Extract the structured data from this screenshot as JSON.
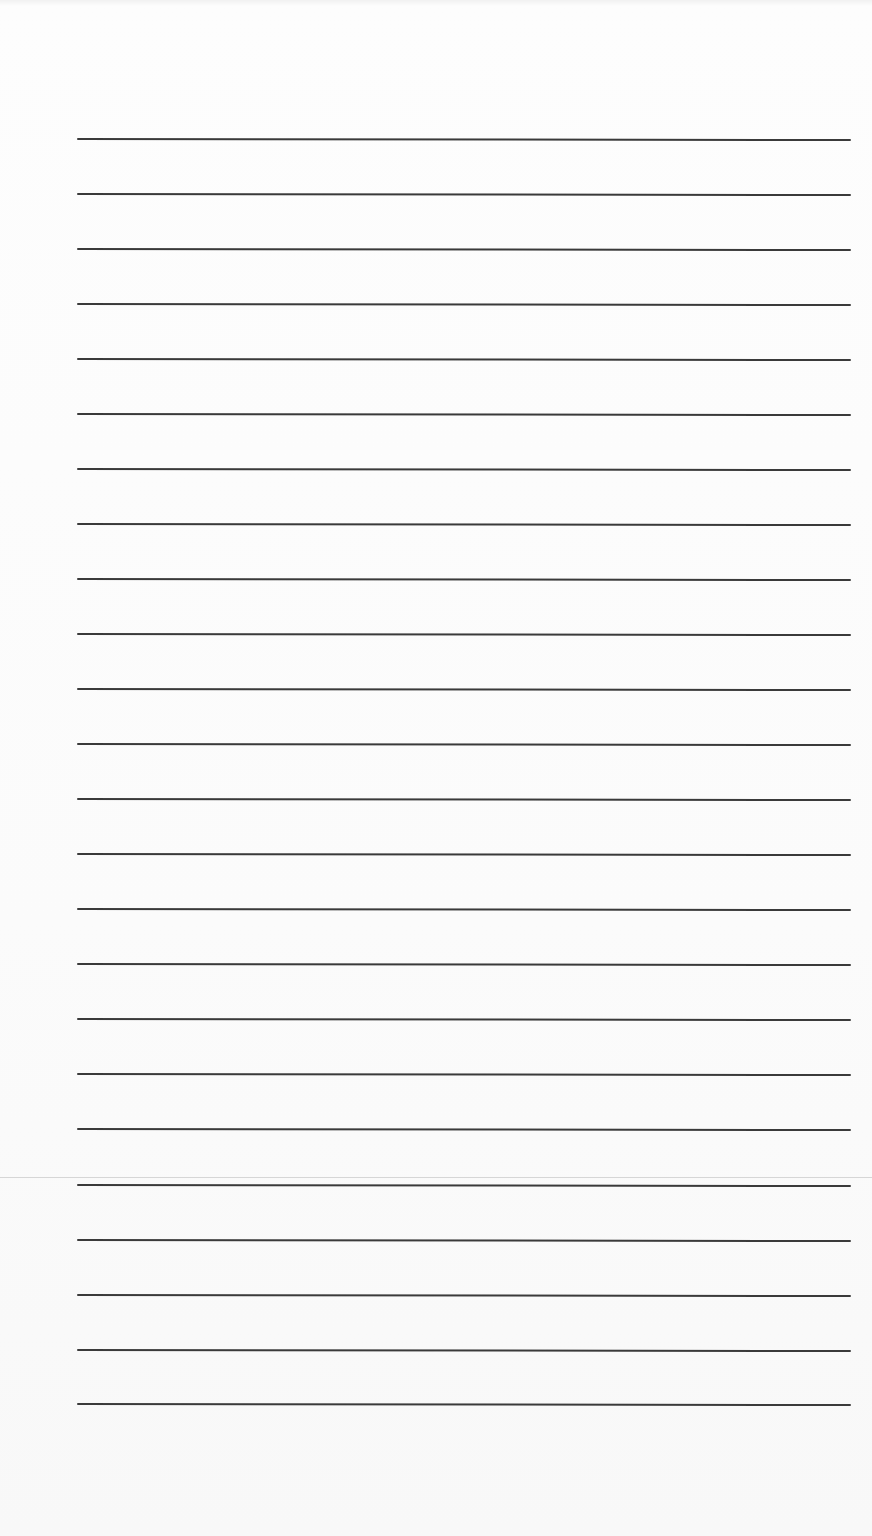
{
  "document": {
    "type": "lined-paper",
    "background_color": "#fcfcfc",
    "rule_color": "#3a3a3a",
    "seam_color": "#d6d6d6",
    "rule_count": 24,
    "rule_left_px": 77,
    "rule_right_px": 851,
    "rules_y_px": [
      138,
      193,
      248,
      303,
      358,
      413,
      468,
      523,
      578,
      633,
      688,
      743,
      798,
      853,
      908,
      963,
      1018,
      1073,
      1128,
      1184,
      1239,
      1294,
      1349,
      1403
    ],
    "seam_y_px": 1177,
    "text_content": []
  }
}
